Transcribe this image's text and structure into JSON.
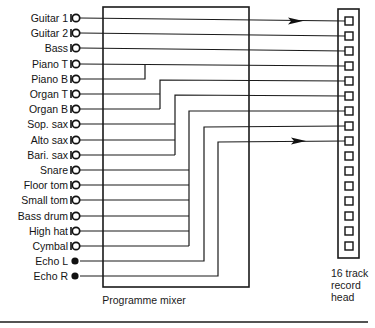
{
  "figure": {
    "inputs": [
      {
        "label": "Guitar 1",
        "connector": "open-jack",
        "track": 1
      },
      {
        "label": "Guitar 2",
        "connector": "open-jack",
        "track": 2
      },
      {
        "label": "Bass",
        "connector": "open-jack",
        "track": 3
      },
      {
        "label": "Piano T",
        "connector": "open-jack",
        "track": 4
      },
      {
        "label": "Piano B",
        "connector": "open-jack",
        "track": 4
      },
      {
        "label": "Organ T",
        "connector": "open-jack",
        "track": 5
      },
      {
        "label": "Organ B",
        "connector": "open-jack",
        "track": 5
      },
      {
        "label": "Sop. sax",
        "connector": "open-jack",
        "track": 6
      },
      {
        "label": "Alto sax",
        "connector": "open-jack",
        "track": 6
      },
      {
        "label": "Bari. sax",
        "connector": "open-jack",
        "track": 6
      },
      {
        "label": "Snare",
        "connector": "open-jack",
        "track": 7
      },
      {
        "label": "Floor tom",
        "connector": "open-jack",
        "track": 7
      },
      {
        "label": "Small tom",
        "connector": "open-jack",
        "track": 7
      },
      {
        "label": "Bass drum",
        "connector": "open-jack",
        "track": 7
      },
      {
        "label": "High hat",
        "connector": "open-jack",
        "track": 7
      },
      {
        "label": "Cymbal",
        "connector": "open-jack",
        "track": 7
      },
      {
        "label": "Echo L",
        "connector": "filled-dot",
        "track": 8
      },
      {
        "label": "Echo R",
        "connector": "filled-dot",
        "track": 9
      }
    ],
    "mixer": {
      "label": "Programme mixer"
    },
    "record_head": {
      "line1": "16 track",
      "line2": "record",
      "line3": "head",
      "track_count": 16,
      "used_tracks": 9
    },
    "arrows_on_tracks": [
      1,
      9
    ]
  }
}
